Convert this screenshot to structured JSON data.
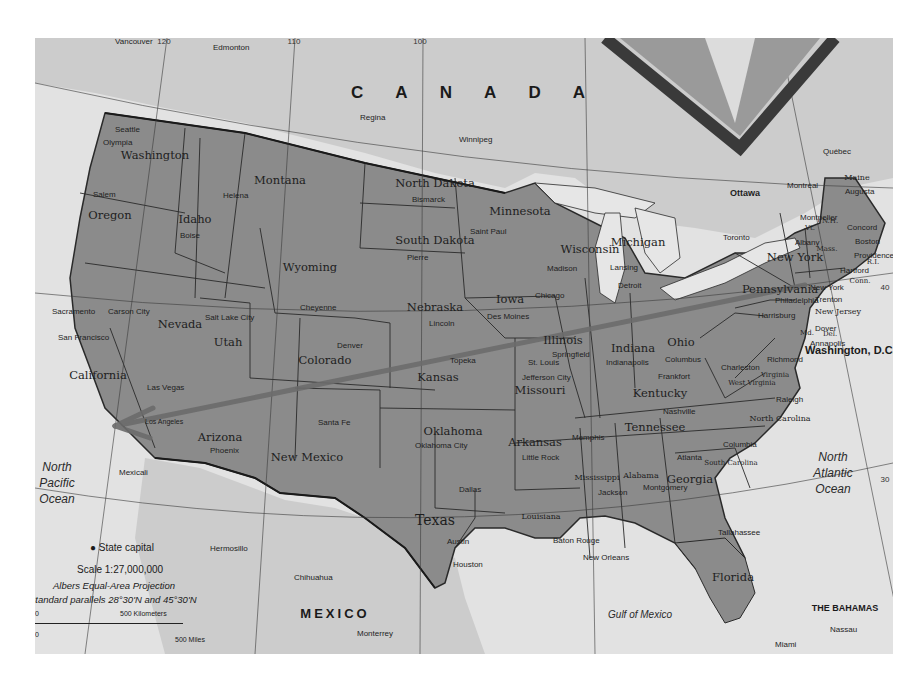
{
  "map": {
    "colors": {
      "us_land": "#8a8a8a",
      "foreign_land": "#cfcfcf",
      "water": "#e4e4e4",
      "border": "#2a2a2a",
      "arrow": "#6a6a6a",
      "inset_frame": "#3a3a3a"
    },
    "countries": {
      "canada": "C A N A D A",
      "mexico": "MEXICO",
      "bahamas": "THE BAHAMAS"
    },
    "oceans": {
      "north_pacific": [
        "North",
        "Pacific",
        "Ocean"
      ],
      "north_atlantic": [
        "North",
        "Atlantic",
        "Ocean"
      ],
      "gulf": "Gulf of Mexico"
    },
    "states": [
      "Washington",
      "Oregon",
      "Idaho",
      "Montana",
      "Wyoming",
      "North Dakota",
      "South Dakota",
      "Minnesota",
      "Nebraska",
      "Iowa",
      "Wisconsin",
      "Michigan",
      "Nevada",
      "Utah",
      "Colorado",
      "California",
      "Kansas",
      "Illinois",
      "Indiana",
      "Ohio",
      "Missouri",
      "Kentucky",
      "Arizona",
      "New Mexico",
      "Oklahoma",
      "Arkansas",
      "Tennessee",
      "Texas",
      "Louisiana",
      "Mississippi",
      "Alabama",
      "Georgia",
      "Florida",
      "Pennsylvania",
      "New York",
      "New Jersey",
      "West Virginia",
      "Virginia",
      "North Carolina",
      "South Carolina",
      "Maine",
      "Vt.",
      "N.H.",
      "Mass.",
      "R.I.",
      "Conn.",
      "Md.",
      "Del."
    ],
    "capitals": [
      "Olympia",
      "Salem",
      "Boise",
      "Helena",
      "Cheyenne",
      "Bismarck",
      "Pierre",
      "Saint Paul",
      "Lincoln",
      "Des Moines",
      "Madison",
      "Lansing",
      "Carson City",
      "Sacramento",
      "Salt Lake City",
      "Denver",
      "Topeka",
      "Springfield",
      "Indianapolis",
      "Columbus",
      "Jefferson City",
      "Frankfort",
      "Phoenix",
      "Santa Fe",
      "Oklahoma City",
      "Little Rock",
      "Nashville",
      "Austin",
      "Baton Rouge",
      "Jackson",
      "Montgomery",
      "Atlanta",
      "Tallahassee",
      "Columbia",
      "Raleigh",
      "Richmond",
      "Charleston",
      "Harrisburg",
      "Trenton",
      "Dover",
      "Annapolis",
      "Albany",
      "Hartford",
      "Providence",
      "Boston",
      "Concord",
      "Montpelier",
      "Augusta"
    ],
    "cities": [
      "Vancouver",
      "Seattle",
      "San Francisco",
      "Los Angeles",
      "Las Vegas",
      "Chicago",
      "Detroit",
      "St. Louis",
      "Memphis",
      "Dallas",
      "Houston",
      "New Orleans",
      "Miami",
      "Philadelphia",
      "New York",
      "Edmonton",
      "Regina",
      "Winnipeg",
      "Toronto",
      "Montréal",
      "Québec",
      "Mexicali",
      "Hermosillo",
      "Chihuahua",
      "Monterrey"
    ],
    "foreign_capitals": [
      "Ottawa",
      "Nassau"
    ],
    "national_capital": "Washington, D.C.",
    "inset_label": "River",
    "grid_labels": {
      "lon_120": "120",
      "lon_110": "110",
      "lon_100": "100",
      "lon_90": "90",
      "lon_80": "80",
      "lat_40": "40",
      "lat_30": "30"
    },
    "annotation": {
      "type": "arrow",
      "from": "New York",
      "to": "Los Angeles"
    }
  },
  "legend": {
    "capital_symbol_label": "State capital",
    "scale": "Scale 1:27,000,000",
    "projection": "Albers Equal-Area Projection",
    "parallels": "Standard parallels 28°30'N and 45°30'N",
    "km_zero": "0",
    "km_label": "500 Kilometers",
    "mi_zero": "0",
    "mi_label": "500 Miles"
  }
}
